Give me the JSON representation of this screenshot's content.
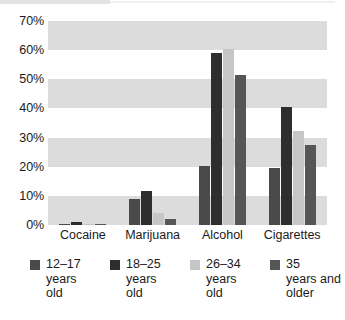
{
  "chart_data": {
    "type": "bar",
    "title": "",
    "subtitle": "",
    "xlabel": "",
    "ylabel": "",
    "categories": [
      "Cocaine",
      "Marijuana",
      "Alcohol",
      "Cigarettes"
    ],
    "series": [
      {
        "name": "12–17 years old",
        "color": "#4a4a4a",
        "values": [
          0.5,
          9.0,
          20.2,
          19.6
        ]
      },
      {
        "name": "18–25 years old",
        "color": "#2e2e2e",
        "values": [
          1.0,
          11.6,
          58.9,
          40.4
        ]
      },
      {
        "name": "26–34 years old",
        "color": "#c6c6c6",
        "values": [
          0.3,
          4.0,
          60.4,
          32.4
        ]
      },
      {
        "name": "35 years and older",
        "color": "#565656",
        "values": [
          0.4,
          2.0,
          51.4,
          27.4
        ]
      }
    ],
    "ylim": [
      0,
      70
    ],
    "yticks": [
      0,
      10,
      20,
      30,
      40,
      50,
      60,
      70
    ],
    "ytick_labels": [
      "0%",
      "10%",
      "20%",
      "30%",
      "40%",
      "50%",
      "60%",
      "70%"
    ],
    "grid": "alternating-horizontal-bands",
    "band_color": "#dcdcdc",
    "plot_background": "#ffffff",
    "legend_position": "bottom"
  },
  "legend": {
    "items": [
      {
        "label": "12–17\nyears\nold"
      },
      {
        "label": "18–25\nyears\nold"
      },
      {
        "label": "26–34\nyears\nold"
      },
      {
        "label": "35\nyears and\nolder"
      }
    ]
  }
}
